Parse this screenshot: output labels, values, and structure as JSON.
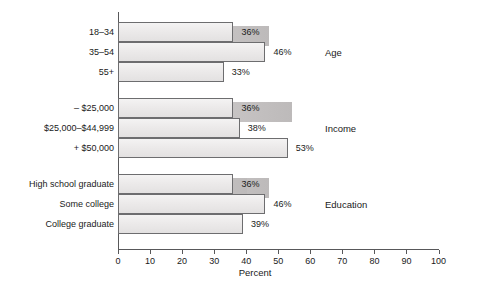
{
  "chart_data": {
    "type": "bar",
    "orientation": "horizontal",
    "title": "",
    "xlabel": "Percent",
    "ylabel": "",
    "xlim": [
      0,
      100
    ],
    "xticks": [
      0,
      10,
      20,
      30,
      40,
      50,
      60,
      70,
      80,
      90,
      100
    ],
    "grid": false,
    "legend": null,
    "value_suffix": "%",
    "groups": [
      {
        "name": "Age",
        "categories": [
          "18–34",
          "35–54",
          "55+"
        ],
        "values": [
          36,
          46,
          33
        ],
        "labels": [
          "36%",
          "46%",
          "33%"
        ]
      },
      {
        "name": "Income",
        "categories": [
          "– $25,000",
          "$25,000–$44,999",
          "+ $50,000"
        ],
        "values": [
          36,
          38,
          53
        ],
        "labels": [
          "36%",
          "38%",
          "53%"
        ]
      },
      {
        "name": "Education",
        "categories": [
          "High school graduate",
          "Some college",
          "College graduate"
        ],
        "values": [
          36,
          46,
          39
        ],
        "labels": [
          "36%",
          "46%",
          "39%"
        ]
      }
    ]
  },
  "colors": {
    "bar_fill": "#eceaea",
    "bar_border": "#6d6d6f",
    "bar_shadow": "#c9c6c6",
    "axis": "#58585a",
    "text": "#1a1a1a",
    "background": "#ffffff"
  }
}
